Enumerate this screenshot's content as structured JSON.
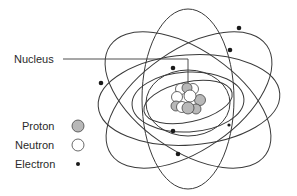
{
  "diagram": {
    "type": "atom-model",
    "labels": {
      "nucleus": "Nucleus"
    },
    "legend": [
      {
        "key": "proton",
        "label": "Proton",
        "symbol": "hatched-circle",
        "color": "#b8b8b8"
      },
      {
        "key": "neutron",
        "label": "Neutron",
        "symbol": "open-circle",
        "color": "#ffffff"
      },
      {
        "key": "electron",
        "label": "Electron",
        "symbol": "small-dot",
        "color": "#1a1a1a"
      }
    ],
    "orbit_count": 7,
    "electron_count": 7,
    "colors": {
      "line": "#3a3a3a",
      "text": "#2a2a2a",
      "background": "#ffffff"
    }
  }
}
